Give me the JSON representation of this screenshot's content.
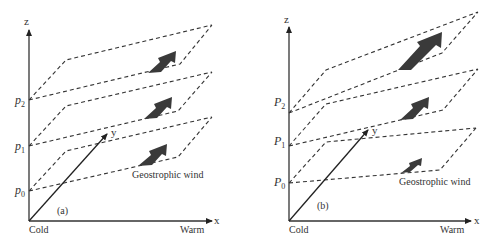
{
  "figure": {
    "panels": [
      {
        "id": "a",
        "label": "(a)",
        "axes": {
          "z": "z",
          "x": "x",
          "y": "y"
        },
        "x_left_label": "Cold",
        "x_right_label": "Warm",
        "levels": [
          {
            "sym": "p",
            "sub": "0"
          },
          {
            "sym": "p",
            "sub": "1"
          },
          {
            "sym": "p",
            "sub": "2"
          }
        ],
        "wind_label": "Geostrophic wind",
        "wind_arrow_sizes": [
          "medium",
          "medium",
          "medium"
        ]
      },
      {
        "id": "b",
        "label": "(b)",
        "axes": {
          "z": "z",
          "x": "x",
          "y": "y"
        },
        "x_left_label": "Cold",
        "x_right_label": "Warm",
        "levels": [
          {
            "sym": "P",
            "sub": "0"
          },
          {
            "sym": "P",
            "sub": "1"
          },
          {
            "sym": "P",
            "sub": "2"
          }
        ],
        "wind_label": "Geostrophic wind",
        "wind_arrow_sizes": [
          "small",
          "medium",
          "large"
        ]
      }
    ]
  },
  "colors": {
    "line": "#333333",
    "arrow_fill": "#3a3a3a",
    "background": "#ffffff"
  }
}
